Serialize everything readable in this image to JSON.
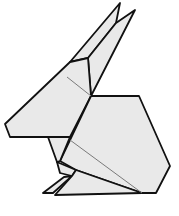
{
  "image": {
    "subject": "Origami rabbit line drawing",
    "width": 179,
    "height": 216
  },
  "colors": {
    "background": "#ffffff",
    "paper_fill": "#e9e9e9",
    "outline": "#111111",
    "crease": "#7a7a7a"
  },
  "parts": {
    "ears": "ears",
    "head": "head",
    "body": "body",
    "front_leg": "front-leg",
    "feet": "feet"
  }
}
